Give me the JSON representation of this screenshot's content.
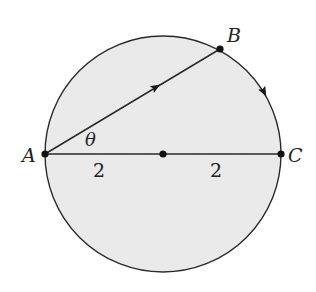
{
  "diagram": {
    "type": "geometry",
    "colors": {
      "background": "#ffffff",
      "circle_fill": "#ebebeb",
      "stroke": "#2a2a2a"
    },
    "points": {
      "A": {
        "label": "A"
      },
      "B": {
        "label": "B"
      },
      "C": {
        "label": "C"
      },
      "center": {
        "label": ""
      }
    },
    "angle_label": "θ",
    "segment_labels": {
      "left_radius": "2",
      "right_radius": "2"
    }
  }
}
